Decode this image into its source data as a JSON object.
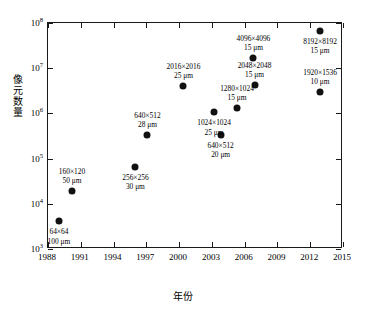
{
  "chart_data": {
    "type": "scatter",
    "title": "",
    "xlabel": "年份",
    "ylabel": "像元数量",
    "xlim": [
      1988,
      2015
    ],
    "ylim_log10": [
      3,
      8
    ],
    "grid": false,
    "legend": null,
    "xticks": [
      "1988",
      "1991",
      "1994",
      "1997",
      "2000",
      "2003",
      "2006",
      "2009",
      "2012",
      "2015"
    ],
    "ytick_exponents": [
      "3",
      "4",
      "5",
      "6",
      "7",
      "8"
    ],
    "ytick_mantissa": "10",
    "points": [
      {
        "label_res": "64×64",
        "label_pitch": "100 μm",
        "x": 1989.0,
        "y": 4100.0,
        "label_pos": "below"
      },
      {
        "label_res": "160×120",
        "label_pitch": "50 μm",
        "x": 1990.2,
        "y": 19200.0,
        "label_pos": "above"
      },
      {
        "label_res": "256×256",
        "label_pitch": "30 μm",
        "x": 1996.0,
        "y": 66000.0,
        "label_pos": "below"
      },
      {
        "label_res": "640×512",
        "label_pitch": "28 μm",
        "x": 1997.1,
        "y": 330000.0,
        "label_pos": "above"
      },
      {
        "label_res": "2016×2016",
        "label_pitch": "25 μm",
        "x": 2000.4,
        "y": 4100000.0,
        "label_pos": "above"
      },
      {
        "label_res": "640×512",
        "label_pitch": "20 μm",
        "x": 2003.8,
        "y": 330000.0,
        "label_pos": "below"
      },
      {
        "label_res": "1024×1024",
        "label_pitch": "25 μm",
        "x": 2003.2,
        "y": 1050000.0,
        "label_pos": "below"
      },
      {
        "label_res": "1280×1024",
        "label_pitch": "15 μm",
        "x": 2005.3,
        "y": 1300000.0,
        "label_pos": "above"
      },
      {
        "label_res": "2048×2048",
        "label_pitch": "15 μm",
        "x": 2006.9,
        "y": 4200000.0,
        "label_pos": "above"
      },
      {
        "label_res": "4096×4096",
        "label_pitch": "15 μm",
        "x": 2006.8,
        "y": 17000000.0,
        "label_pos": "above"
      },
      {
        "label_res": "1920×1536",
        "label_pitch": "10 μm",
        "x": 2012.9,
        "y": 3000000.0,
        "label_pos": "above"
      },
      {
        "label_res": "8192×8192",
        "label_pitch": "15 μm",
        "x": 2012.9,
        "y": 66000000.0,
        "label_pos": "below"
      }
    ]
  }
}
